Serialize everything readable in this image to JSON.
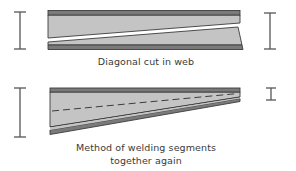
{
  "figure": {
    "panels": [
      {
        "id": "diagonal-cut",
        "caption": "Diagonal cut in web"
      },
      {
        "id": "welded-taper",
        "caption_line1": "Method of welding segments",
        "caption_line2": "together again"
      }
    ],
    "colors": {
      "web_fill": "#c4c4c4",
      "flange_fill": "#7a7a7a",
      "outline": "#3c3c3c",
      "symbol": "#555555",
      "background": "#ffffff"
    }
  }
}
